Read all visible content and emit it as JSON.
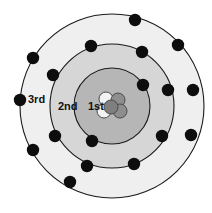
{
  "diagram": {
    "canvas": {
      "width": 212,
      "height": 213,
      "background": "#ffffff"
    },
    "center": {
      "x": 112,
      "y": 106
    },
    "colors": {
      "shell_outline": "#1a1a1a",
      "shell_fill_1st": "#b6b6b6",
      "shell_fill_2nd": "#d6d6d6",
      "shell_fill_3rd": "#efefef",
      "electron": "#0d0d0d",
      "nucleon_dark": "#8e8e8e",
      "nucleon_light": "#f2f2f2",
      "nucleon_outline": "#4a4a4a",
      "label_text": "#111111"
    },
    "shells": [
      {
        "name": "1st",
        "label": "1st",
        "label_x": 88,
        "label_y": 110,
        "radius": 38,
        "fill": "#b6b6b6",
        "electron_count": 2,
        "electrons": [
          {
            "x": 143,
            "y": 85
          },
          {
            "x": 92,
            "y": 141
          }
        ]
      },
      {
        "name": "2nd",
        "label": "2nd",
        "label_x": 58,
        "label_y": 110,
        "radius": 62,
        "fill": "#d6d6d6",
        "electron_count": 8,
        "electrons": [
          {
            "x": 91,
            "y": 46
          },
          {
            "x": 142,
            "y": 52
          },
          {
            "x": 168,
            "y": 90
          },
          {
            "x": 162,
            "y": 136
          },
          {
            "x": 134,
            "y": 164
          },
          {
            "x": 87,
            "y": 166
          },
          {
            "x": 55,
            "y": 136
          },
          {
            "x": 53,
            "y": 75
          }
        ]
      },
      {
        "name": "3rd",
        "label": "3rd",
        "label_x": 28,
        "label_y": 103,
        "radius": 92,
        "fill": "#efefef",
        "electron_count": 8,
        "electrons": [
          {
            "x": 135,
            "y": 20
          },
          {
            "x": 178,
            "y": 45
          },
          {
            "x": 193,
            "y": 90
          },
          {
            "x": 191,
            "y": 135
          },
          {
            "x": 70,
            "y": 182
          },
          {
            "x": 33,
            "y": 150
          },
          {
            "x": 20,
            "y": 100
          },
          {
            "x": 33,
            "y": 58
          }
        ]
      }
    ],
    "nucleus": {
      "name": "nucleus",
      "particle_count": 5,
      "particles": [
        {
          "x": 106,
          "y": 99,
          "r": 7,
          "fill": "#f2f2f2",
          "kind": "light"
        },
        {
          "x": 118,
          "y": 100,
          "r": 7,
          "fill": "#8e8e8e",
          "kind": "dark"
        },
        {
          "x": 120,
          "y": 111,
          "r": 7,
          "fill": "#8e8e8e",
          "kind": "dark"
        },
        {
          "x": 104,
          "y": 111,
          "r": 7,
          "fill": "#f2f2f2",
          "kind": "light"
        },
        {
          "x": 111,
          "y": 107,
          "r": 7,
          "fill": "#7f7f7f",
          "kind": "dark"
        }
      ]
    }
  }
}
